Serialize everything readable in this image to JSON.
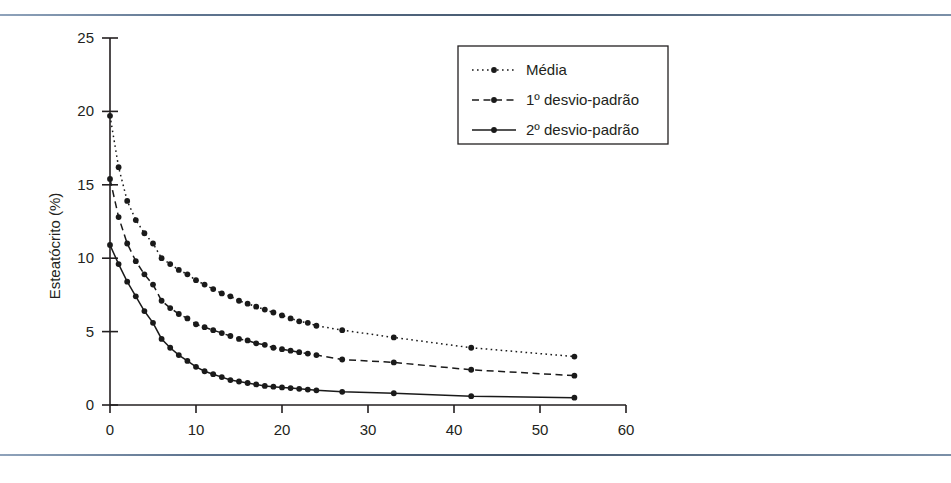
{
  "figure": {
    "background_color": "#ffffff",
    "rule_color": "#4b6078",
    "axis_color": "#231f20",
    "series_color": "#1a1a1a"
  },
  "chart_data": {
    "type": "line",
    "title": "",
    "subtitle": "",
    "xlabel": "",
    "ylabel": "Esteatócrito (%)",
    "xlim": [
      0,
      60
    ],
    "ylim": [
      0,
      25
    ],
    "xticks": [
      0,
      10,
      20,
      30,
      40,
      50,
      60
    ],
    "yticks": [
      0,
      5,
      10,
      15,
      20,
      25
    ],
    "xticklabels": [
      "0",
      "10",
      "20",
      "30",
      "40",
      "50",
      "60"
    ],
    "yticklabels": [
      "0",
      "5",
      "10",
      "15",
      "20",
      "25"
    ],
    "grid": false,
    "legend_position": "top-center",
    "markers": "filled-circle",
    "x": [
      0,
      1,
      2,
      3,
      4,
      5,
      6,
      7,
      8,
      9,
      10,
      11,
      12,
      13,
      14,
      15,
      16,
      17,
      18,
      19,
      20,
      21,
      22,
      23,
      24,
      27,
      33,
      42,
      54
    ],
    "series": [
      {
        "name": "Média",
        "linestyle": "dotted",
        "values": [
          19.7,
          16.2,
          13.9,
          12.6,
          11.7,
          11.0,
          10.0,
          9.6,
          9.2,
          8.9,
          8.5,
          8.2,
          7.9,
          7.6,
          7.4,
          7.1,
          6.9,
          6.7,
          6.5,
          6.3,
          6.1,
          5.9,
          5.7,
          5.6,
          5.4,
          5.1,
          4.6,
          3.9,
          3.3
        ]
      },
      {
        "name": "1º desvio-padrão",
        "linestyle": "dashed",
        "values": [
          15.4,
          12.8,
          11.0,
          9.8,
          8.9,
          8.2,
          7.1,
          6.6,
          6.2,
          5.9,
          5.5,
          5.3,
          5.1,
          4.9,
          4.7,
          4.5,
          4.4,
          4.2,
          4.1,
          3.9,
          3.8,
          3.7,
          3.6,
          3.5,
          3.4,
          3.1,
          2.9,
          2.4,
          2.0
        ]
      },
      {
        "name": "2º desvio-padrão",
        "linestyle": "solid",
        "values": [
          10.9,
          9.6,
          8.4,
          7.4,
          6.4,
          5.6,
          4.5,
          3.9,
          3.4,
          3.0,
          2.6,
          2.3,
          2.1,
          1.9,
          1.7,
          1.6,
          1.5,
          1.4,
          1.3,
          1.25,
          1.2,
          1.15,
          1.1,
          1.05,
          1.0,
          0.9,
          0.8,
          0.6,
          0.5
        ]
      }
    ]
  },
  "legend": {
    "items": [
      {
        "label": "Média",
        "style": "dotted"
      },
      {
        "label": "1º desvio-padrão",
        "style": "dashed"
      },
      {
        "label": "2º desvio-padrão",
        "style": "solid"
      }
    ]
  }
}
